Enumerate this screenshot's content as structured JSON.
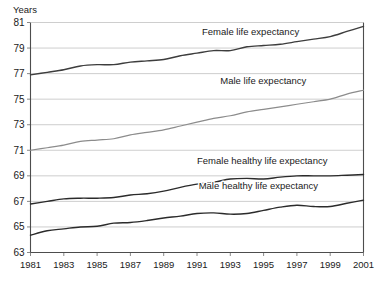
{
  "chart_data": {
    "type": "line",
    "title": "",
    "xlabel": "",
    "ylabel": "Years",
    "ylim": [
      63,
      81
    ],
    "xlim": [
      1981,
      2001
    ],
    "grid": true,
    "legend_position": "inline-labels",
    "y_ticks": [
      "63",
      "65",
      "67",
      "69",
      "71",
      "73",
      "75",
      "77",
      "79",
      "81"
    ],
    "x_ticks": [
      "1981",
      "1983",
      "1985",
      "1987",
      "1989",
      "1991",
      "1993",
      "1995",
      "1997",
      "1999",
      "2001"
    ],
    "x": [
      1981,
      1982,
      1983,
      1984,
      1985,
      1986,
      1987,
      1988,
      1989,
      1990,
      1991,
      1992,
      1993,
      1994,
      1995,
      1996,
      1997,
      1998,
      1999,
      2000,
      2001
    ],
    "series": [
      {
        "name": "Female life expectancy",
        "color": "#3d3d3d",
        "label_x": 1991.3,
        "label_y": 80.0,
        "values": [
          76.9,
          77.1,
          77.3,
          77.6,
          77.7,
          77.7,
          77.9,
          78.0,
          78.1,
          78.4,
          78.6,
          78.8,
          78.8,
          79.1,
          79.2,
          79.3,
          79.5,
          79.7,
          79.9,
          80.3,
          80.7
        ]
      },
      {
        "name": "Male life expectancy",
        "color": "#8c8c8c",
        "label_x": 1992.4,
        "label_y": 76.2,
        "values": [
          71.0,
          71.2,
          71.4,
          71.7,
          71.8,
          71.9,
          72.2,
          72.4,
          72.6,
          72.9,
          73.2,
          73.5,
          73.7,
          74.0,
          74.2,
          74.4,
          74.6,
          74.8,
          75.0,
          75.4,
          75.7
        ]
      },
      {
        "name": "Female healthy life expectancy",
        "color": "#2b2b2b",
        "label_x": 1991.0,
        "label_y": 69.9,
        "values": [
          66.8,
          67.0,
          67.2,
          67.25,
          67.25,
          67.3,
          67.5,
          67.6,
          67.8,
          68.1,
          68.35,
          68.5,
          68.75,
          68.8,
          68.75,
          68.9,
          69.0,
          69.0,
          69.0,
          69.05,
          69.1
        ]
      },
      {
        "name": "Male healthy life expectancy",
        "color": "#2b2b2b",
        "label_x": 1991.1,
        "label_y": 68.0,
        "values": [
          64.35,
          64.7,
          64.85,
          65.0,
          65.05,
          65.3,
          65.35,
          65.5,
          65.7,
          65.85,
          66.05,
          66.1,
          66.0,
          66.05,
          66.3,
          66.55,
          66.7,
          66.6,
          66.6,
          66.85,
          67.1
        ]
      }
    ]
  }
}
